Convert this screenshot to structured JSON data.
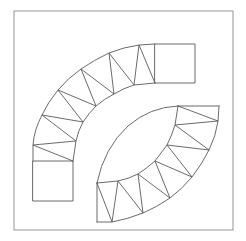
{
  "diagram": {
    "title": "",
    "colors": {
      "background": "#ffffff",
      "line": "#5a5a5a",
      "frame": "#8a8a8a"
    },
    "frame": {
      "x": 14,
      "y": 11,
      "width": 219,
      "height": 219
    },
    "upper_band": {
      "outer_arc": "M33,161 L33,145 Q34,130 42,115 Q48,102 58,90 Q68,78 81,69 Q94,60 109,53 Q124,47 139,45 L155,44",
      "inner_arc": "M73,161 L76,141 Q78,131 83,122 Q89,113 96,106 Q104,99 114,94 Q124,88 134,85 L155,83",
      "zigzag": [
        [
          73,
          161
        ],
        [
          33,
          145
        ],
        [
          76,
          141
        ],
        [
          42,
          115
        ],
        [
          83,
          122
        ],
        [
          58,
          90
        ],
        [
          96,
          106
        ],
        [
          81,
          69
        ],
        [
          114,
          94
        ],
        [
          109,
          53
        ],
        [
          134,
          85
        ],
        [
          139,
          45
        ],
        [
          155,
          83
        ]
      ],
      "end_square_left": {
        "x": 33,
        "y": 161,
        "width": 40,
        "height": 40
      },
      "end_square_top": {
        "x": 155,
        "y": 44,
        "width": 40,
        "height": 39
      }
    },
    "lower_band": {
      "outer_arc": "M219,106 L218,121 Q216,136 209,150 Q202,164 192,177 Q182,189 170,198 Q157,207 143,213 Q128,219 112,222 L97,222",
      "inner_arc": "M178,106 Q150,107 128,126 Q104,148 97,183",
      "inner_tri_arc": "M178,106 L175,125 Q172,135 167,145 Q161,153 155,161 Q147,168 138,174 Q128,179 118,181 L97,183",
      "zigzag": [
        [
          178,
          106
        ],
        [
          218,
          121
        ],
        [
          175,
          125
        ],
        [
          209,
          150
        ],
        [
          167,
          145
        ],
        [
          192,
          177
        ],
        [
          155,
          161
        ],
        [
          170,
          198
        ],
        [
          138,
          174
        ],
        [
          143,
          213
        ],
        [
          118,
          181
        ],
        [
          112,
          222
        ],
        [
          97,
          183
        ]
      ],
      "top_edge": [
        [
          178,
          106
        ],
        [
          219,
          106
        ]
      ],
      "left_edge": [
        [
          97,
          183
        ],
        [
          97,
          222
        ]
      ]
    }
  }
}
